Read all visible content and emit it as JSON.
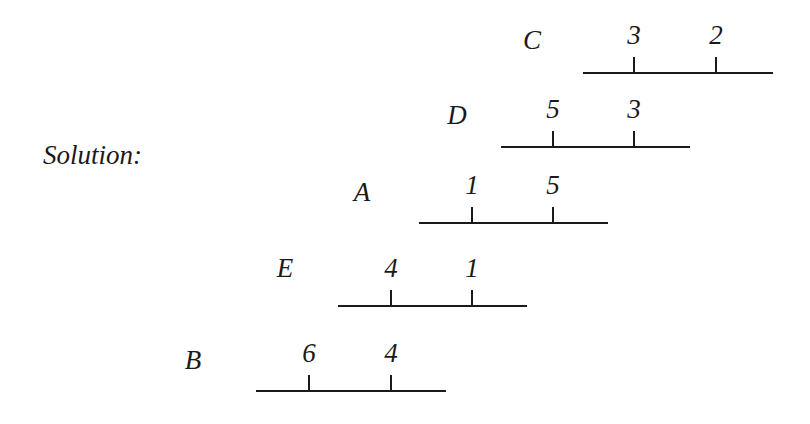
{
  "label": "Solution:",
  "rows": [
    {
      "letter": "C",
      "letter_x": 532,
      "letter_y": 40,
      "line_x1": 583,
      "line_x2": 773,
      "line_y": 73,
      "ticks": [
        {
          "x": 634,
          "label": "3"
        },
        {
          "x": 716,
          "label": "2"
        }
      ]
    },
    {
      "letter": "D",
      "letter_x": 457,
      "letter_y": 115,
      "line_x1": 501,
      "line_x2": 690,
      "line_y": 147,
      "ticks": [
        {
          "x": 553,
          "label": "5"
        },
        {
          "x": 634,
          "label": "3"
        }
      ]
    },
    {
      "letter": "A",
      "letter_x": 362,
      "letter_y": 192,
      "line_x1": 419,
      "line_x2": 608,
      "line_y": 223,
      "ticks": [
        {
          "x": 472,
          "label": "1"
        },
        {
          "x": 553,
          "label": "5"
        }
      ]
    },
    {
      "letter": "E",
      "letter_x": 285,
      "letter_y": 268,
      "line_x1": 338,
      "line_x2": 527,
      "line_y": 306,
      "ticks": [
        {
          "x": 391,
          "label": "4"
        },
        {
          "x": 472,
          "label": "1"
        }
      ]
    },
    {
      "letter": "B",
      "letter_x": 193,
      "letter_y": 360,
      "line_x1": 256,
      "line_x2": 446,
      "line_y": 391,
      "ticks": [
        {
          "x": 309,
          "label": "6"
        },
        {
          "x": 391,
          "label": "4"
        }
      ]
    }
  ]
}
